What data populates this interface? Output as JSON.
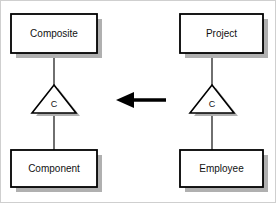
{
  "diagram": {
    "type": "uml-class-diagram",
    "title": "",
    "background_color": "#ffffff",
    "border_color": "#cfcfcf",
    "box_fill": "#ffffff",
    "box_stroke": "#000000",
    "shadow_color": "#b0b0b0",
    "line_color": "#333333",
    "arrow_color": "#000000",
    "groups": [
      {
        "name": "composite-pattern-group",
        "top_box": {
          "label": "Composite"
        },
        "connector_symbol": {
          "label": "C",
          "shape": "triangle"
        },
        "bottom_box": {
          "label": "Component"
        }
      },
      {
        "name": "project-instance-group",
        "top_box": {
          "label": "Project"
        },
        "connector_symbol": {
          "label": "C",
          "shape": "triangle"
        },
        "bottom_box": {
          "label": "Employee"
        }
      }
    ],
    "arrow": {
      "name": "mapping-arrow",
      "direction": "left",
      "label": ""
    }
  }
}
